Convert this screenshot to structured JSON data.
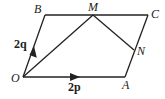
{
  "diagram": {
    "title": "",
    "points": {
      "O": {
        "label": "O",
        "x": 23,
        "y": 77
      },
      "A": {
        "label": "A",
        "x": 125,
        "y": 77
      },
      "B": {
        "label": "B",
        "x": 45,
        "y": 15
      },
      "C": {
        "label": "C",
        "x": 148,
        "y": 15
      },
      "M": {
        "label": "M",
        "x": 93,
        "y": 15
      },
      "N": {
        "label": "N",
        "x": 134,
        "y": 50
      }
    },
    "vectors": {
      "OA": {
        "label": "2p"
      },
      "OB": {
        "label": "2q"
      }
    },
    "segments": [
      "OA",
      "AC",
      "CB",
      "BO",
      "OM",
      "MN"
    ],
    "colors": {
      "line": "#222222",
      "background": "#ffffff"
    }
  }
}
